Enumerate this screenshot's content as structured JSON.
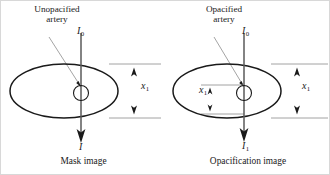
{
  "figure": {
    "colors": {
      "ink": "#1a1a1a",
      "beam_line": "#5a5a5a",
      "leader_line": "#9a9a9a",
      "guide_line": "#8c8c8c",
      "background": "#ffffff"
    }
  },
  "panels": [
    {
      "id": "mask",
      "callout": {
        "line1": "Unopacified",
        "line2": "artery"
      },
      "incident_beam_label": "I",
      "incident_beam_sub": "0",
      "thickness_label": "x",
      "thickness_sub": "1",
      "exit_beam_label": "I",
      "exit_beam_sub": "",
      "caption": "Mask image"
    },
    {
      "id": "opacification",
      "callout": {
        "line1": "Opacified",
        "line2": "artery"
      },
      "incident_beam_label": "I",
      "incident_beam_sub": "0",
      "thickness_label": "x",
      "thickness_sub": "1",
      "inner_thickness_label": "x",
      "inner_thickness_sub": "1",
      "exit_beam_label": "I",
      "exit_beam_sub": "1",
      "caption": "Opacification image"
    }
  ]
}
